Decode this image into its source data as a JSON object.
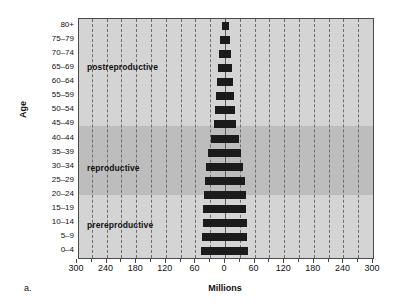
{
  "panel": {
    "letter": "a."
  },
  "axes": {
    "y_title": "Age",
    "x_title": "Millions",
    "x_ticks": [
      "300",
      "240",
      "180",
      "120",
      "60",
      "0",
      "60",
      "120",
      "180",
      "240",
      "300"
    ],
    "age_groups": [
      "80+",
      "75–79",
      "70–74",
      "65–69",
      "60–64",
      "55–59",
      "50–54",
      "45–49",
      "40–44",
      "35–39",
      "30–34",
      "25–29",
      "20–24",
      "15–19",
      "10–14",
      "5–9",
      "0–4"
    ]
  },
  "zones": [
    {
      "label": "postreproductive"
    },
    {
      "label": "reproductive"
    },
    {
      "label": "prereproductive"
    }
  ],
  "colors": {
    "bar": "#1b1b1b",
    "band_light": "#d4d4d4",
    "band_dark": "#bdbdbd",
    "grid": "#6d6d6d",
    "frame": "#4a4a4a"
  },
  "chart_data": {
    "type": "bar",
    "title": "",
    "subtitle": "",
    "xlabel": "Millions",
    "ylabel": "Age",
    "xlim": [
      -300,
      300
    ],
    "xticks": [
      -300,
      -240,
      -180,
      -120,
      -60,
      0,
      60,
      120,
      180,
      240,
      300
    ],
    "xticklabels": [
      "300",
      "240",
      "180",
      "120",
      "60",
      "0",
      "60",
      "120",
      "180",
      "240",
      "300"
    ],
    "grid": "vertical-dashed",
    "legend": "none",
    "orientation": "horizontal-diverging",
    "categories": [
      "0–4",
      "5–9",
      "10–14",
      "15–19",
      "20–24",
      "25–29",
      "30–34",
      "35–39",
      "40–44",
      "45–49",
      "50–54",
      "55–59",
      "60–64",
      "65–69",
      "70–74",
      "75–79",
      "80+"
    ],
    "series": [
      {
        "name": "male",
        "side": "left",
        "values": [
          48,
          46,
          45,
          44,
          43,
          41,
          38,
          34,
          28,
          23,
          21,
          19,
          17,
          14,
          12,
          10,
          7
        ]
      },
      {
        "name": "female",
        "side": "right",
        "values": [
          47,
          45,
          44,
          43,
          42,
          40,
          37,
          33,
          28,
          23,
          21,
          19,
          17,
          14,
          12,
          10,
          9
        ]
      }
    ],
    "annotations": [
      {
        "text": "prereproductive",
        "covers": [
          "0–4",
          "5–9",
          "10–14"
        ]
      },
      {
        "text": "reproductive",
        "covers": [
          "20–24",
          "25–29",
          "30–34",
          "35–39",
          "40–44"
        ]
      },
      {
        "text": "postreproductive",
        "covers": [
          "50–54",
          "55–59",
          "60–64",
          "65–69",
          "70–74",
          "75–79",
          "80+"
        ]
      }
    ],
    "shaded_bands": [
      {
        "name": "postreproductive",
        "tone": "light"
      },
      {
        "name": "reproductive",
        "tone": "dark"
      },
      {
        "name": "prereproductive",
        "tone": "light"
      }
    ]
  }
}
